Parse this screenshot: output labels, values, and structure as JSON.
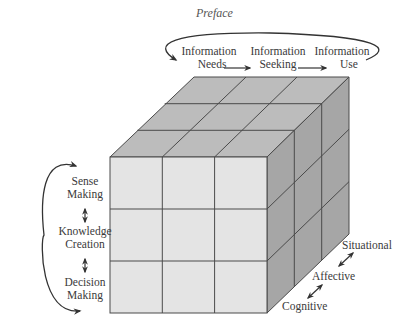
{
  "page": {
    "header": "Preface"
  },
  "diagram": {
    "colors": {
      "front": "#e4e4e4",
      "top": "#bcbcbc",
      "side": "#a6a6a6",
      "edge": "#4a4a4a",
      "text": "#3a3a3a"
    },
    "top_axis": {
      "items": [
        {
          "line1": "Information",
          "line2": "Needs"
        },
        {
          "line1": "Information",
          "line2": "Seeking"
        },
        {
          "line1": "Information",
          "line2": "Use"
        }
      ],
      "cycle_arrow": "loop-back-arrow"
    },
    "left_axis": {
      "items": [
        {
          "line1": "Sense",
          "line2": "Making"
        },
        {
          "line1": "Knowledge",
          "line2": "Creation"
        },
        {
          "line1": "Decision",
          "line2": "Making"
        }
      ],
      "cycle_arrow": "loop-back-arrow"
    },
    "depth_axis": {
      "items": [
        "Cognitive",
        "Affective",
        "Situational"
      ]
    },
    "grid": {
      "rows": 3,
      "cols": 3,
      "depth": 3
    }
  }
}
